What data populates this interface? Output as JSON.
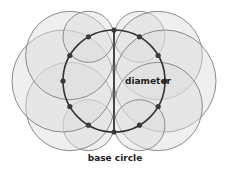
{
  "diagram": {
    "base_circle": {
      "cx": 114,
      "cy": 81,
      "r": 51,
      "stroke": "#333333"
    },
    "diameter": {
      "x1": 114,
      "y1": 29,
      "x2": 114,
      "y2": 133,
      "stroke": "#333333"
    },
    "dot_count": 12,
    "circle_fill": "#dcdcdc",
    "circle_fill_opacity": 0.45,
    "circle_stroke": "#808080",
    "dot_color": "#3a3a3a",
    "labels": {
      "diameter": "diameter",
      "base_circle": "base circle"
    }
  }
}
